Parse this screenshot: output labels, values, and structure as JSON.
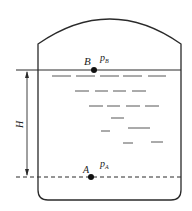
{
  "diagram": {
    "colors": {
      "stroke": "#2a2a2a",
      "background": "#ffffff"
    },
    "labels": {
      "point_b": "B",
      "pressure_b_main": "p",
      "pressure_b_sub": "B",
      "point_a": "A",
      "pressure_a_main": "p",
      "pressure_a_sub": "A",
      "height": "H"
    },
    "elements": {
      "liquid_surface": "solid line at liquid level through point B",
      "reference_line": "dashed line through point A",
      "height_dimension": "double-headed arrow between surface and dashed line"
    }
  }
}
